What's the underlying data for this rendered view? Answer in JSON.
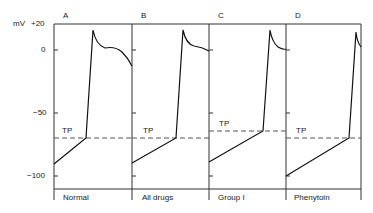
{
  "figure": {
    "y_axis": {
      "unit": "mV",
      "ticks": [
        {
          "label": "+20",
          "value": 20
        },
        {
          "label": "0",
          "value": 0
        },
        {
          "label": "−50",
          "value": -50
        },
        {
          "label": "−100",
          "value": -100
        }
      ]
    },
    "threshold_label": "TP",
    "panels": [
      {
        "letter": "A",
        "caption": "Normal",
        "threshold_mV": -70
      },
      {
        "letter": "B",
        "caption": "All drugs",
        "threshold_mV": -70
      },
      {
        "letter": "C",
        "caption": "Group I",
        "threshold_mV": -64
      },
      {
        "letter": "D",
        "caption": "Phenytoin",
        "threshold_mV": -70
      }
    ]
  }
}
